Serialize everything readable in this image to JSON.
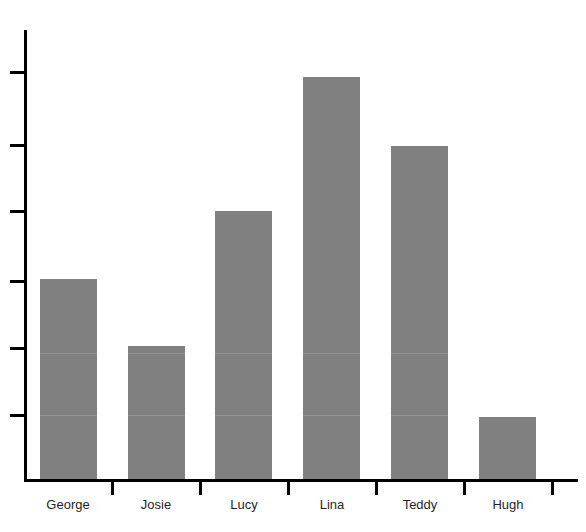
{
  "chart_data": {
    "type": "bar",
    "title": "Who would like to work in Chinese?",
    "xlabel": "",
    "ylabel": "",
    "categories": [
      "George",
      "Josie",
      "Lucy",
      "Lina",
      "Teddy",
      "Hugh"
    ],
    "values": [
      3,
      2,
      4,
      6,
      5,
      0.93
    ],
    "ylim": [
      0,
      6.8
    ],
    "y_tick_values": [
      1,
      2,
      3,
      4,
      5,
      6
    ],
    "y_tick_labels": [
      "",
      "",
      "",
      "",
      "",
      ""
    ],
    "grid": false,
    "legend": false,
    "bar_color": "#808080",
    "axis_color": "#000000",
    "background_color": "#ffffff",
    "bars": [
      {
        "label": "George",
        "value": 3,
        "left": 40,
        "top": 279,
        "width": 57,
        "height": 200
      },
      {
        "label": "Josie",
        "value": 2,
        "left": 128,
        "top": 346,
        "width": 57,
        "height": 133
      },
      {
        "label": "Lucy",
        "value": 4,
        "left": 215,
        "top": 211,
        "width": 57,
        "height": 268
      },
      {
        "label": "Lina",
        "value": 6,
        "left": 303,
        "top": 77,
        "width": 57,
        "height": 402
      },
      {
        "label": "Teddy",
        "value": 5,
        "left": 391,
        "top": 146,
        "width": 57,
        "height": 333
      },
      {
        "label": "Hugh",
        "value": 0.93,
        "left": 479,
        "top": 417,
        "width": 57,
        "height": 62
      }
    ],
    "y_ticks_px": [
      72,
      145,
      211,
      281,
      348,
      415
    ],
    "x_ticks_px": [
      112,
      200,
      288,
      376,
      464,
      552
    ],
    "category_label_centers_px": [
      68,
      156,
      244,
      332,
      420,
      508
    ],
    "bar_seams_px": [
      353,
      415
    ]
  }
}
